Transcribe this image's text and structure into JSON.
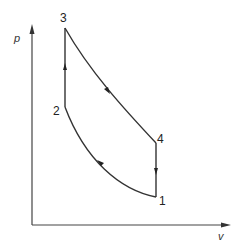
{
  "diagram": {
    "type": "pv-diagram",
    "axes": {
      "y_label": "p",
      "x_label": "v"
    },
    "points": [
      {
        "id": "1",
        "label": "1"
      },
      {
        "id": "2",
        "label": "2"
      },
      {
        "id": "3",
        "label": "3"
      },
      {
        "id": "4",
        "label": "4"
      }
    ],
    "processes": [
      {
        "from": "1",
        "to": "2",
        "shape": "curve",
        "direction": "left-up"
      },
      {
        "from": "2",
        "to": "3",
        "shape": "vertical",
        "direction": "up"
      },
      {
        "from": "3",
        "to": "4",
        "shape": "curve",
        "direction": "right-down"
      },
      {
        "from": "4",
        "to": "1",
        "shape": "vertical",
        "direction": "down"
      }
    ],
    "colors": {
      "line": "#333333",
      "background": "#ffffff"
    }
  }
}
